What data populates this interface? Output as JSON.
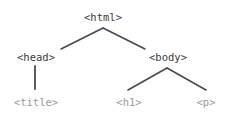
{
  "diagram": {
    "type": "dom-tree",
    "background_color": "#ffffff",
    "colors": {
      "internal_node_text": "#3b3b3b",
      "leaf_node_text": "#9a9a9a",
      "edge_line": "#4a4a4a"
    },
    "nodes": [
      {
        "id": "html",
        "label": "<html>",
        "level": 0,
        "kind": "internal",
        "x": 103,
        "y": 17
      },
      {
        "id": "head",
        "label": "<head>",
        "level": 1,
        "kind": "internal",
        "x": 36,
        "y": 57
      },
      {
        "id": "body",
        "label": "<body>",
        "level": 1,
        "kind": "internal",
        "x": 168,
        "y": 57
      },
      {
        "id": "title",
        "label": "<title>",
        "level": 2,
        "kind": "leaf",
        "x": 36,
        "y": 102
      },
      {
        "id": "h1",
        "label": "<h1>",
        "level": 2,
        "kind": "leaf",
        "x": 129,
        "y": 102
      },
      {
        "id": "p",
        "label": "<p>",
        "level": 2,
        "kind": "leaf",
        "x": 206,
        "y": 102
      }
    ],
    "edges": [
      {
        "id": "html-head",
        "from": "html",
        "to": "head",
        "x1": 103,
        "y1": 28,
        "x2": 61,
        "y2": 49
      },
      {
        "id": "html-body",
        "from": "html",
        "to": "body",
        "x1": 103,
        "y1": 28,
        "x2": 145,
        "y2": 49
      },
      {
        "id": "head-title",
        "from": "head",
        "to": "title",
        "x1": 35,
        "y1": 66,
        "x2": 35,
        "y2": 89
      },
      {
        "id": "body-h1",
        "from": "body",
        "to": "h1",
        "x1": 167,
        "y1": 68,
        "x2": 128,
        "y2": 90
      },
      {
        "id": "body-p",
        "from": "body",
        "to": "p",
        "x1": 167,
        "y1": 68,
        "x2": 206,
        "y2": 90
      }
    ]
  }
}
